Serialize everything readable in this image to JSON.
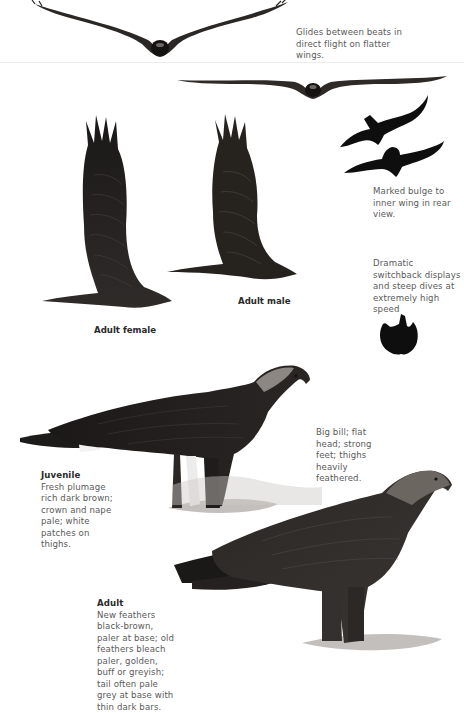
{
  "flight": {
    "glide_note": "Glides between beats in direct flight on flatter wings.",
    "rear_view_note": "Marked bulge to inner wing in rear view.",
    "display_note": "Dramatic switchback displays and steep dives at extremely high speed",
    "female_caption": "Adult female",
    "male_caption": "Adult male"
  },
  "perched": {
    "bill_note": "Big bill; flat head; strong feet; thighs heavily feathered.",
    "juvenile": {
      "title": "Juvenile",
      "text": "Fresh plumage rich dark brown; crown and nape pale; white patches on thighs."
    },
    "adult": {
      "title": "Adult",
      "text": "New feathers black-brown, paler at base; old feathers bleach paler, golden, buff or greyish; tail often pale grey at base with thin dark bars."
    }
  },
  "colors": {
    "background": "#ffffff",
    "text": "#5a5a5a",
    "caption": "#2a2a2a",
    "bird_dark": "#1e1c1b",
    "bird_mid": "#3a3633",
    "divider": "#ececec"
  },
  "icons": {
    "glide_front_top": "eagle-glide-front-view",
    "glide_front_bottom": "eagle-glide-front-view-flat",
    "silhouette_rear_1": "eagle-silhouette-rear-view",
    "silhouette_rear_2": "eagle-silhouette-rear-view",
    "silhouette_dive": "eagle-silhouette-dive"
  }
}
